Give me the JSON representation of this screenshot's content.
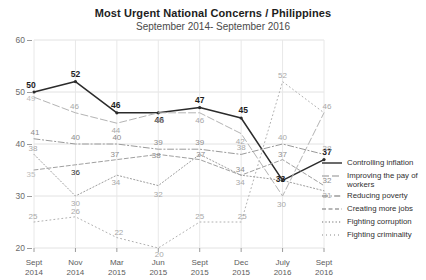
{
  "chart_data": {
    "type": "line",
    "title": "Most Urgent National Concerns / Philippines",
    "subtitle": "September 2014- September 2016",
    "xlabel": "",
    "ylabel": "",
    "ylim": [
      20,
      60
    ],
    "yticks": [
      20,
      30,
      40,
      50,
      60
    ],
    "grid": true,
    "legend_position": "right",
    "categories": [
      "Sept\n2014",
      "Nov\n2014",
      "Mar\n2015",
      "Jun\n2015",
      "Sept\n2015",
      "Dec\n2015",
      "July\n2016",
      "Sept\n2016"
    ],
    "category_lines": [
      [
        "Sept",
        "2014"
      ],
      [
        "Nov",
        "2014"
      ],
      [
        "Mar",
        "2015"
      ],
      [
        "Jun",
        "2015"
      ],
      [
        "Sept",
        "2015"
      ],
      [
        "Dec",
        "2015"
      ],
      [
        "July",
        "2016"
      ],
      [
        "Sept",
        "2016"
      ]
    ],
    "series": [
      {
        "name": "Controlling inflation",
        "style": "solid",
        "color": "#2b2b2b",
        "emphasis": true,
        "values": [
          50,
          52,
          46,
          46,
          47,
          45,
          33,
          37
        ]
      },
      {
        "name": "Improving the pay of workers",
        "style": "long-dash",
        "color": "#b4b4b4",
        "emphasis": false,
        "values": [
          49,
          46,
          44,
          46,
          46,
          42,
          30,
          46
        ]
      },
      {
        "name": "Reducing poverty",
        "style": "dash-dot",
        "color": "#9a9a9a",
        "emphasis": false,
        "values": [
          41,
          40,
          40,
          39,
          39,
          38,
          40,
          38
        ]
      },
      {
        "name": "Creating more jobs",
        "style": "dashed",
        "color": "#a0a0a0",
        "emphasis": false,
        "values": [
          35,
          36,
          37,
          38,
          37,
          34,
          37,
          32
        ]
      },
      {
        "name": "Fighting corruption",
        "style": "dotted",
        "color": "#9e9e9e",
        "emphasis": false,
        "values": [
          38,
          30,
          34,
          32,
          38,
          34,
          33,
          31
        ]
      },
      {
        "name": "Fighting criminality",
        "style": "fine-dotted",
        "color": "#b0b0b0",
        "emphasis": false,
        "values": [
          25,
          26,
          22,
          20,
          25,
          25,
          52,
          46
        ]
      }
    ],
    "point_labels": [
      {
        "series": "Controlling inflation",
        "index": 0,
        "text": "50",
        "weight": "bold",
        "dx": -3,
        "dy": -7
      },
      {
        "series": "Controlling inflation",
        "index": 1,
        "text": "52",
        "weight": "bold",
        "dx": 0,
        "dy": -8
      },
      {
        "series": "Controlling inflation",
        "index": 2,
        "text": "46",
        "weight": "bold",
        "dx": -1,
        "dy": -8
      },
      {
        "series": "Controlling inflation",
        "index": 3,
        "text": "46",
        "weight": "bold",
        "dx": 1,
        "dy": 7
      },
      {
        "series": "Controlling inflation",
        "index": 4,
        "text": "47",
        "weight": "bold",
        "dx": 0,
        "dy": -8
      },
      {
        "series": "Controlling inflation",
        "index": 5,
        "text": "45",
        "weight": "bold",
        "dx": 2,
        "dy": -8
      },
      {
        "series": "Controlling inflation",
        "index": 6,
        "text": "33",
        "weight": "bold",
        "dx": -2,
        "dy": -1
      },
      {
        "series": "Controlling inflation",
        "index": 7,
        "text": "37",
        "weight": "bold",
        "dx": 3,
        "dy": -8
      },
      {
        "series": "Improving the pay of workers",
        "index": 0,
        "text": "49",
        "weight": "vlight",
        "dx": -3,
        "dy": 1
      },
      {
        "series": "Improving the pay of workers",
        "index": 1,
        "text": "46",
        "weight": "light",
        "dx": -1,
        "dy": -7
      },
      {
        "series": "Improving the pay of workers",
        "index": 2,
        "text": "44",
        "weight": "light",
        "dx": -1,
        "dy": 7
      },
      {
        "series": "Improving the pay of workers",
        "index": 3,
        "text": "46",
        "weight": "light",
        "dx": 1,
        "dy": 7
      },
      {
        "series": "Improving the pay of workers",
        "index": 4,
        "text": "46",
        "weight": "light",
        "dx": 0,
        "dy": 7
      },
      {
        "series": "Improving the pay of workers",
        "index": 5,
        "text": "42",
        "weight": "light",
        "dx": -1,
        "dy": 7
      },
      {
        "series": "Improving the pay of workers",
        "index": 6,
        "text": "30",
        "weight": "light",
        "dx": -1,
        "dy": 8
      },
      {
        "series": "Improving the pay of workers",
        "index": 7,
        "text": "46",
        "weight": "light",
        "dx": 3,
        "dy": -7
      },
      {
        "series": "Reducing poverty",
        "index": 0,
        "text": "41",
        "weight": "mid",
        "dx": 1,
        "dy": -7
      },
      {
        "series": "Reducing poverty",
        "index": 1,
        "text": "40",
        "weight": "mid",
        "dx": 0,
        "dy": -7
      },
      {
        "series": "Reducing poverty",
        "index": 2,
        "text": "40",
        "weight": "mid",
        "dx": 0,
        "dy": -7
      },
      {
        "series": "Reducing poverty",
        "index": 3,
        "text": "39",
        "weight": "mid",
        "dx": 0,
        "dy": -7
      },
      {
        "series": "Reducing poverty",
        "index": 4,
        "text": "39",
        "weight": "mid",
        "dx": 0,
        "dy": -7
      },
      {
        "series": "Reducing poverty",
        "index": 5,
        "text": "38",
        "weight": "light",
        "dx": 0,
        "dy": -7
      },
      {
        "series": "Reducing poverty",
        "index": 6,
        "text": "40",
        "weight": "light",
        "dx": 0,
        "dy": -7
      },
      {
        "series": "Reducing poverty",
        "index": 7,
        "text": "38",
        "weight": "light",
        "dx": 3,
        "dy": -6
      },
      {
        "series": "Creating more jobs",
        "index": 0,
        "text": "35",
        "weight": "vlight",
        "dx": -3,
        "dy": 4
      },
      {
        "series": "Creating more jobs",
        "index": 1,
        "text": "36",
        "weight": "dark",
        "dx": 0,
        "dy": 7
      },
      {
        "series": "Creating more jobs",
        "index": 2,
        "text": "37",
        "weight": "mid",
        "dx": -2,
        "dy": -6
      },
      {
        "series": "Creating more jobs",
        "index": 3,
        "text": "38",
        "weight": "mid",
        "dx": -2,
        "dy": 1
      },
      {
        "series": "Creating more jobs",
        "index": 4,
        "text": "37",
        "weight": "mid",
        "dx": 1,
        "dy": -6
      },
      {
        "series": "Creating more jobs",
        "index": 5,
        "text": "34",
        "weight": "mid",
        "dx": -1,
        "dy": -6
      },
      {
        "series": "Creating more jobs",
        "index": 6,
        "text": "37",
        "weight": "mid",
        "dx": 0,
        "dy": -6
      },
      {
        "series": "Creating more jobs",
        "index": 7,
        "text": "32",
        "weight": "mid",
        "dx": 3,
        "dy": -6
      },
      {
        "series": "Fighting corruption",
        "index": 0,
        "text": "38",
        "weight": "light",
        "dx": -1,
        "dy": -6
      },
      {
        "series": "Fighting corruption",
        "index": 1,
        "text": "30",
        "weight": "light",
        "dx": 0,
        "dy": 7
      },
      {
        "series": "Fighting corruption",
        "index": 2,
        "text": "34",
        "weight": "light",
        "dx": -1,
        "dy": 7
      },
      {
        "series": "Fighting corruption",
        "index": 3,
        "text": "32",
        "weight": "light",
        "dx": 0,
        "dy": 8
      },
      {
        "series": "Fighting corruption",
        "index": 5,
        "text": "34",
        "weight": "light",
        "dx": -1,
        "dy": 7
      },
      {
        "series": "Fighting corruption",
        "index": 7,
        "text": "31",
        "weight": "light",
        "dx": 3,
        "dy": 4
      },
      {
        "series": "Fighting criminality",
        "index": 0,
        "text": "25",
        "weight": "light",
        "dx": -1,
        "dy": -6
      },
      {
        "series": "Fighting criminality",
        "index": 1,
        "text": "26",
        "weight": "light",
        "dx": 0,
        "dy": -6
      },
      {
        "series": "Fighting criminality",
        "index": 2,
        "text": "22",
        "weight": "light",
        "dx": 2,
        "dy": -6
      },
      {
        "series": "Fighting criminality",
        "index": 3,
        "text": "20",
        "weight": "light",
        "dx": 1,
        "dy": 6
      },
      {
        "series": "Fighting criminality",
        "index": 4,
        "text": "25",
        "weight": "light",
        "dx": 0,
        "dy": -6
      },
      {
        "series": "Fighting criminality",
        "index": 5,
        "text": "25",
        "weight": "light",
        "dx": 1,
        "dy": -6
      },
      {
        "series": "Fighting criminality",
        "index": 6,
        "text": "52",
        "weight": "light",
        "dx": 0,
        "dy": -7
      }
    ]
  },
  "legend": {
    "items": [
      {
        "label": "Controlling inflation",
        "style": "solid",
        "color": "#2b2b2b"
      },
      {
        "label": "Improving the pay of workers",
        "style": "long-dash",
        "color": "#b4b4b4"
      },
      {
        "label": "Reducing poverty",
        "style": "dash-dot",
        "color": "#9a9a9a"
      },
      {
        "label": "Creating more jobs",
        "style": "dashed",
        "color": "#a0a0a0"
      },
      {
        "label": "Fighting corruption",
        "style": "dotted",
        "color": "#9e9e9e"
      },
      {
        "label": "Fighting criminality",
        "style": "fine-dotted",
        "color": "#b0b0b0"
      }
    ]
  }
}
